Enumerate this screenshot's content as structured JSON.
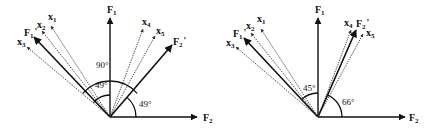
{
  "diagrams": [
    {
      "id": "left",
      "origin": [
        110,
        117
      ],
      "axes": {
        "F1": {
          "label": "F",
          "sub": "1",
          "tip": [
            110,
            18
          ],
          "label_pos": [
            107,
            13
          ]
        },
        "F2": {
          "label": "F",
          "sub": "2",
          "tip": [
            197,
            117
          ],
          "label_pos": [
            203,
            121
          ]
        }
      },
      "vectors": [
        {
          "name": "x1",
          "label": "x",
          "sub": "1",
          "style": "dotted",
          "tip": [
            51,
            26
          ],
          "label_pos": [
            48,
            20
          ]
        },
        {
          "name": "x2",
          "label": "x",
          "sub": "2",
          "style": "dotted",
          "tip": [
            42,
            31
          ],
          "label_pos": [
            37,
            28
          ]
        },
        {
          "name": "F1'",
          "label": "F",
          "sub": "1",
          "prime": "'",
          "style": "solid",
          "tip": [
            34,
            37
          ],
          "label_pos": [
            24,
            36
          ]
        },
        {
          "name": "x3",
          "label": "x",
          "sub": "3",
          "style": "dotted",
          "tip": [
            27,
            47
          ],
          "label_pos": [
            17,
            45
          ]
        },
        {
          "name": "x4",
          "label": "x",
          "sub": "4",
          "style": "dotted",
          "tip": [
            143,
            29
          ],
          "label_pos": [
            142,
            25
          ]
        },
        {
          "name": "x5",
          "label": "x",
          "sub": "5",
          "style": "dotted",
          "tip": [
            155,
            36
          ],
          "label_pos": [
            156,
            34
          ]
        },
        {
          "name": "F2'",
          "label": "F",
          "sub": "2",
          "prime": "'",
          "style": "solid",
          "tip": [
            172,
            45
          ],
          "label_pos": [
            173,
            45
          ]
        }
      ],
      "angles": [
        {
          "label": "90°",
          "radius": 36,
          "from_deg": 139,
          "to_deg": 41,
          "label_pos": [
            96,
            68
          ]
        },
        {
          "label": "49°",
          "radius": 22,
          "from_deg": 139,
          "to_deg": 90,
          "label_pos": [
            95,
            88
          ]
        },
        {
          "label": "49°",
          "radius": 26,
          "from_deg": 49,
          "to_deg": 0,
          "label_pos": [
            139,
            107
          ]
        }
      ]
    },
    {
      "id": "right",
      "origin": [
        318,
        117
      ],
      "axes": {
        "F1": {
          "label": "F",
          "sub": "1",
          "tip": [
            318,
            18
          ],
          "label_pos": [
            315,
            13
          ]
        },
        "F2": {
          "label": "F",
          "sub": "2",
          "tip": [
            405,
            117
          ],
          "label_pos": [
            409,
            121
          ]
        }
      },
      "vectors": [
        {
          "name": "x1",
          "label": "x",
          "sub": "1",
          "style": "dotted",
          "tip": [
            261,
            29
          ],
          "label_pos": [
            257,
            22
          ]
        },
        {
          "name": "x2",
          "label": "x",
          "sub": "2",
          "style": "dotted",
          "tip": [
            251,
            33
          ],
          "label_pos": [
            246,
            29
          ]
        },
        {
          "name": "F1'",
          "label": "F",
          "sub": "1",
          "prime": "'",
          "style": "solid",
          "tip": [
            244,
            38
          ],
          "label_pos": [
            233,
            37
          ]
        },
        {
          "name": "x3",
          "label": "x",
          "sub": "3",
          "style": "dotted",
          "tip": [
            236,
            47
          ],
          "label_pos": [
            226,
            46
          ]
        },
        {
          "name": "x4",
          "label": "x",
          "sub": "4",
          "style": "dotted",
          "tip": [
            351,
            30
          ],
          "label_pos": [
            344,
            26
          ]
        },
        {
          "name": "F2'",
          "label": "F",
          "sub": "2",
          "prime": "'",
          "style": "solid",
          "tip": [
            356,
            30
          ],
          "label_pos": [
            356,
            27
          ]
        },
        {
          "name": "x5",
          "label": "x",
          "sub": "5",
          "style": "dotted",
          "tip": [
            363,
            34
          ],
          "label_pos": [
            366,
            36
          ]
        }
      ],
      "angles": [
        {
          "label": "45°",
          "radius": 24,
          "from_deg": 135,
          "to_deg": 90,
          "label_pos": [
            303,
            91
          ]
        },
        {
          "label": "66°",
          "radius": 24,
          "from_deg": 66,
          "to_deg": 0,
          "label_pos": [
            342,
            105
          ]
        }
      ]
    }
  ],
  "colors": {
    "ink": "#111111",
    "background": "#ffffff"
  }
}
